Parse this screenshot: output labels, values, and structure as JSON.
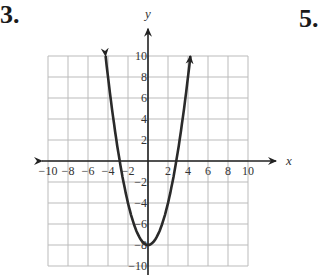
{
  "problem_numbers": {
    "left": "3.",
    "right": "5."
  },
  "chart_data": {
    "type": "line",
    "title": "",
    "xlabel": "x",
    "ylabel": "y",
    "function": "y = x^2 - 8",
    "xlim": [
      -10,
      10
    ],
    "ylim": [
      -10,
      10
    ],
    "grid": true,
    "grid_step": 2,
    "x_ticks": [
      "-10",
      "-8",
      "-6",
      "-4",
      "-2",
      "2",
      "4",
      "6",
      "8",
      "10"
    ],
    "y_ticks": [
      "10",
      "8",
      "6",
      "4",
      "2",
      "-2",
      "-4",
      "-6",
      "-8",
      "-10"
    ],
    "series": [
      {
        "name": "parabola",
        "x": [
          -4.24,
          -4,
          -3,
          -2,
          -1,
          0,
          1,
          2,
          3,
          4,
          4.24
        ],
        "y": [
          10,
          8,
          1,
          -4,
          -7,
          -8,
          -7,
          -4,
          1,
          8,
          10
        ]
      }
    ],
    "vertex": [
      0,
      -8
    ],
    "x_intercepts": [
      -2.83,
      2.83
    ],
    "arrows_on_ends": true
  }
}
